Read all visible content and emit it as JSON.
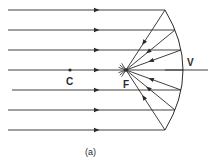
{
  "diagram": {
    "type": "ray-diagram",
    "incident_ray_count": 7,
    "labels": {
      "center_of_curvature": "C",
      "focal_point": "F",
      "vertex": "V",
      "caption": "(a)"
    },
    "colors": {
      "ink": "#2a2a2a",
      "background": "#ffffff"
    }
  }
}
